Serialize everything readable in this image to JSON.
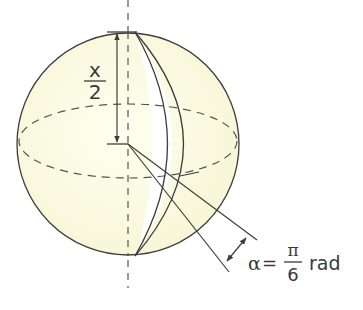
{
  "figure": {
    "colors": {
      "sphere_fill": "#fbfbe2",
      "stroke": "#3d3d3d",
      "wedge_fill": "#ffffff",
      "text": "#3a3a3a"
    },
    "height_label": {
      "numerator": "x",
      "denominator": "2"
    },
    "angle_label": {
      "symbol": "α",
      "equals": "=",
      "numerator": "π",
      "denominator": "6",
      "unit": "rad"
    }
  }
}
